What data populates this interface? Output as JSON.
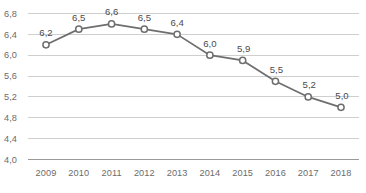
{
  "chart_data": {
    "type": "line",
    "title": "",
    "subtitle": "",
    "xlabel": "",
    "ylabel": "",
    "categories": [
      "2009",
      "2010",
      "2011",
      "2012",
      "2013",
      "2014",
      "2015",
      "2016",
      "2017",
      "2018"
    ],
    "values": [
      6.2,
      6.5,
      6.6,
      6.5,
      6.4,
      6.0,
      5.9,
      5.5,
      5.2,
      5.0
    ],
    "data_labels": [
      "6,2",
      "6,5",
      "6,6",
      "6,5",
      "6,4",
      "6,0",
      "5,9",
      "5,5",
      "5,2",
      "5,0"
    ],
    "ylim": [
      4.0,
      6.8
    ],
    "ytick_values": [
      6.8,
      6.4,
      6.0,
      5.6,
      5.2,
      4.8,
      4.4,
      4.0
    ],
    "ytick_labels": [
      "6,8",
      "6,4",
      "6,0",
      "5,6",
      "5,2",
      "4,8",
      "4,4",
      "4,0"
    ],
    "grid": true,
    "legend": false,
    "legend_position": "none",
    "decimal_separator": ",",
    "colors": {
      "line": "#6e6e6e",
      "marker_fill": "#ffffff",
      "marker_stroke": "#6e6e6e",
      "gridline": "#cfcfcf",
      "baseline": "#9a9a9a",
      "axis_text": "#6b6b6b",
      "label_text": "#4a4a4a",
      "background": "#ffffff"
    }
  }
}
